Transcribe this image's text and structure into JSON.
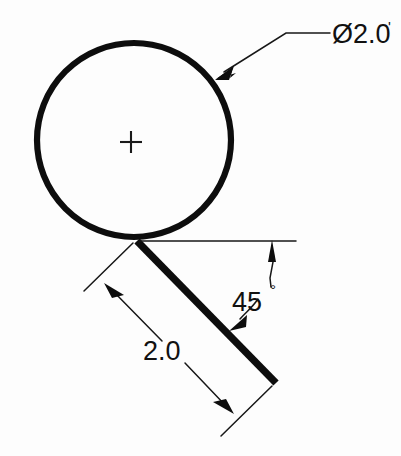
{
  "drawing": {
    "title": "Circle and tangent line dimensioned drawing",
    "background_color": "#fdfdfd",
    "line_color": "#0d0d0d",
    "annotations": {
      "diameter_label": "Ø2.0",
      "diameter_label_suffix": "'",
      "angle_label": "45",
      "angle_label_degree": "°",
      "length_label": "2.0"
    },
    "geometry": {
      "circle": {
        "center_x": 134,
        "center_y": 140,
        "radius": 97,
        "diameter_value": "2.0"
      },
      "center_mark": {
        "x": 131,
        "y": 142,
        "size": 11
      },
      "tangent_line": {
        "start_x": 137,
        "start_y": 241,
        "end_x": 276,
        "end_y": 383,
        "length_value": "2.0",
        "angle_value": "45"
      },
      "horizontal_reference": {
        "start_x": 140,
        "start_y": 241,
        "end_x": 296,
        "end_y": 241
      }
    }
  }
}
